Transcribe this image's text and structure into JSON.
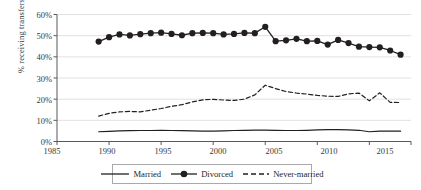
{
  "chart_data": {
    "type": "line",
    "title": "",
    "xlabel": "",
    "ylabel": "% receiving transfers",
    "xlim": [
      1985,
      2019
    ],
    "ylim": [
      0,
      60
    ],
    "xticks": [
      "1985",
      "1990",
      "1995",
      "2000",
      "2005",
      "2010",
      "2015"
    ],
    "yticks": [
      "0%",
      "10%",
      "20%",
      "30%",
      "40%",
      "50%",
      "60%"
    ],
    "grid": "horizontal",
    "legend_position": "bottom",
    "x": [
      1989,
      1990,
      1991,
      1992,
      1993,
      1994,
      1995,
      1996,
      1997,
      1998,
      1999,
      2000,
      2001,
      2002,
      2003,
      2004,
      2005,
      2006,
      2007,
      2008,
      2009,
      2010,
      2011,
      2012,
      2013,
      2014,
      2015,
      2016,
      2017,
      2018
    ],
    "series": [
      {
        "name": "Married",
        "style": "solid",
        "marker": "none",
        "color": "#231f20",
        "values": [
          4.6,
          4.8,
          5.0,
          5.1,
          5.2,
          5.2,
          5.3,
          5.2,
          5.1,
          5.0,
          4.9,
          4.9,
          5.0,
          5.2,
          5.3,
          5.4,
          5.4,
          5.3,
          5.2,
          5.2,
          5.3,
          5.5,
          5.6,
          5.6,
          5.5,
          5.3,
          4.6,
          4.9,
          4.9,
          4.9
        ]
      },
      {
        "name": "Divorced",
        "style": "solid",
        "marker": "circle",
        "color": "#231f20",
        "values": [
          47.2,
          49.3,
          50.6,
          50.1,
          50.7,
          51.2,
          51.4,
          50.8,
          50.2,
          51.2,
          51.3,
          51.2,
          50.6,
          50.8,
          51.3,
          51.2,
          54.2,
          47.4,
          47.8,
          48.5,
          47.4,
          47.5,
          45.8,
          48.0,
          46.5,
          44.8,
          44.6,
          44.5,
          43.0,
          41.0
        ]
      },
      {
        "name": "Never-married",
        "style": "dashed",
        "marker": "none",
        "color": "#231f20",
        "values": [
          12.0,
          13.3,
          14.0,
          14.2,
          14.0,
          14.8,
          15.6,
          16.6,
          17.4,
          18.7,
          19.7,
          19.9,
          19.6,
          19.4,
          20.0,
          22.0,
          26.6,
          25.0,
          23.6,
          22.9,
          22.4,
          21.8,
          21.4,
          21.3,
          22.5,
          22.9,
          19.2,
          23.0,
          18.5,
          18.4
        ]
      }
    ]
  },
  "legend": {
    "items": [
      {
        "label": "Married"
      },
      {
        "label": "Divorced"
      },
      {
        "label": "Never-married"
      }
    ]
  }
}
